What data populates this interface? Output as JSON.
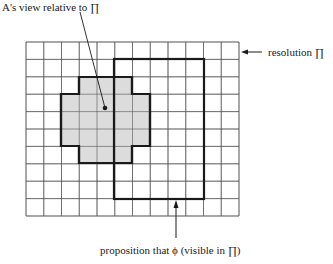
{
  "diagram": {
    "grid": {
      "columns": 12,
      "rows": 10
    },
    "colors": {
      "grid_line": "#555555",
      "outline": "#1a1a1a",
      "view_fill": "#dcdcdc",
      "background": "#ffffff"
    },
    "view_region": {
      "description": "cross-shaped set of grid cells",
      "narrow_columns": [
        4,
        7
      ],
      "wide_columns": [
        3,
        8
      ],
      "top_row": 2,
      "wide_rows": [
        3,
        5
      ],
      "bottom_row": 6
    },
    "proposition_region": {
      "columns": [
        5,
        10
      ],
      "rows": [
        1,
        9
      ]
    },
    "labels": {
      "view": "A's view relative to ∏",
      "resolution": "resolution ∏",
      "proposition": "proposition that ϕ (visible in ∏)"
    }
  }
}
